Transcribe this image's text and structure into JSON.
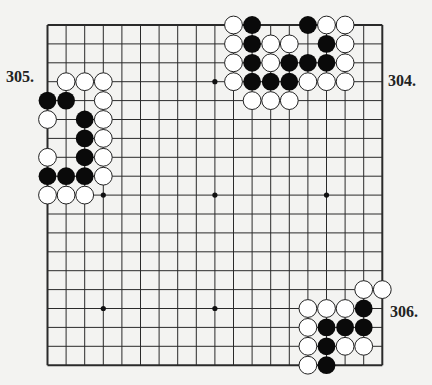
{
  "board": {
    "size": 19,
    "origin_x": 47.5,
    "origin_y": 25,
    "spacing_x": 18.6,
    "spacing_y": 18.9,
    "line_color": "#2a2a2a",
    "star_points": [
      [
        3,
        3
      ],
      [
        3,
        9
      ],
      [
        3,
        15
      ],
      [
        9,
        3
      ],
      [
        9,
        9
      ],
      [
        9,
        15
      ],
      [
        15,
        3
      ],
      [
        15,
        9
      ],
      [
        15,
        15
      ]
    ]
  },
  "problems": [
    {
      "label": "304.",
      "label_pos": {
        "x": 388,
        "y": 72
      },
      "black": [
        [
          11,
          0
        ],
        [
          14,
          0
        ],
        [
          11,
          1
        ],
        [
          15,
          1
        ],
        [
          11,
          2
        ],
        [
          13,
          2
        ],
        [
          14,
          2
        ],
        [
          15,
          2
        ],
        [
          11,
          3
        ],
        [
          12,
          3
        ],
        [
          13,
          3
        ]
      ],
      "white": [
        [
          10,
          0
        ],
        [
          15,
          0
        ],
        [
          16,
          0
        ],
        [
          10,
          1
        ],
        [
          12,
          1
        ],
        [
          13,
          1
        ],
        [
          16,
          1
        ],
        [
          10,
          2
        ],
        [
          12,
          2
        ],
        [
          16,
          2
        ],
        [
          10,
          3
        ],
        [
          14,
          3
        ],
        [
          15,
          3
        ],
        [
          16,
          3
        ],
        [
          11,
          4
        ],
        [
          12,
          4
        ],
        [
          13,
          4
        ]
      ]
    },
    {
      "label": "305.",
      "label_pos": {
        "x": 6,
        "y": 68
      },
      "black": [
        [
          0,
          4
        ],
        [
          1,
          4
        ],
        [
          2,
          5
        ],
        [
          2,
          6
        ],
        [
          2,
          7
        ],
        [
          0,
          8
        ],
        [
          1,
          8
        ],
        [
          2,
          8
        ]
      ],
      "white": [
        [
          1,
          3
        ],
        [
          2,
          3
        ],
        [
          3,
          3
        ],
        [
          3,
          4
        ],
        [
          0,
          5
        ],
        [
          3,
          5
        ],
        [
          3,
          6
        ],
        [
          0,
          7
        ],
        [
          3,
          7
        ],
        [
          3,
          8
        ],
        [
          0,
          9
        ],
        [
          1,
          9
        ],
        [
          2,
          9
        ]
      ]
    },
    {
      "label": "306.",
      "label_pos": {
        "x": 390,
        "y": 303
      },
      "black": [
        [
          17,
          15
        ],
        [
          15,
          16
        ],
        [
          16,
          16
        ],
        [
          17,
          16
        ],
        [
          15,
          17
        ],
        [
          15,
          18
        ]
      ],
      "white": [
        [
          17,
          14
        ],
        [
          18,
          14
        ],
        [
          14,
          15
        ],
        [
          15,
          15
        ],
        [
          16,
          15
        ],
        [
          14,
          16
        ],
        [
          14,
          17
        ],
        [
          16,
          17
        ],
        [
          17,
          17
        ],
        [
          14,
          18
        ]
      ]
    }
  ]
}
